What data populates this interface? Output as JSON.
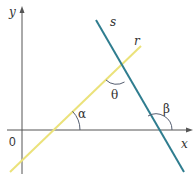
{
  "diagram": {
    "type": "geometry-lines-angles",
    "axes": {
      "x_label": "x",
      "y_label": "y",
      "origin_label": "0",
      "color": "#555555"
    },
    "lines": [
      {
        "name": "r",
        "label": "r",
        "color": "#ebe27a",
        "description": "increasing line crossing x-axis at angle alpha"
      },
      {
        "name": "s",
        "label": "s",
        "color": "#2f7d8f",
        "description": "decreasing line crossing x-axis at angle beta"
      }
    ],
    "angles": [
      {
        "symbol": "α",
        "label": "alpha",
        "between": "x-axis and line r"
      },
      {
        "symbol": "θ",
        "label": "theta",
        "between": "line r and line s"
      },
      {
        "symbol": "β",
        "label": "beta",
        "between": "x-axis and line s"
      }
    ],
    "arc_color": "#555e70"
  }
}
